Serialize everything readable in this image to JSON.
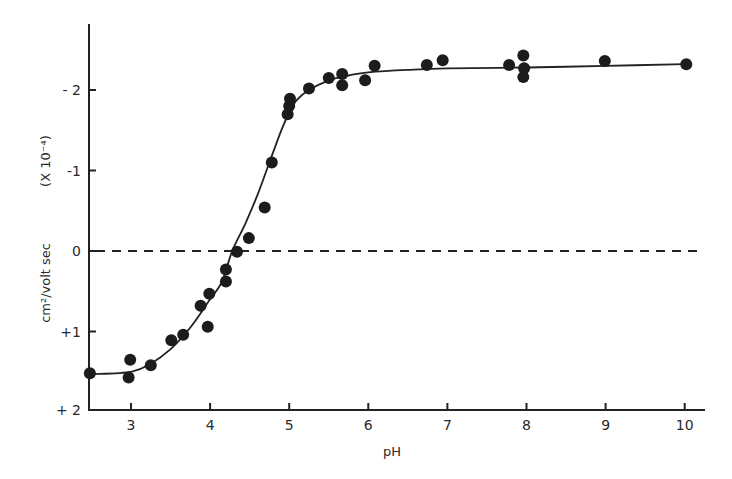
{
  "chart_data": {
    "type": "scatter",
    "title": "",
    "xlabel": "pH",
    "ylabel": "cm²/volt sec   (X 10⁻⁴)",
    "ylabel_parts": {
      "units": "cm²/volt sec",
      "scale": "(X 10⁻⁴)"
    },
    "xlim": [
      2.5,
      10.25
    ],
    "ylim": [
      2,
      -2.8
    ],
    "y_axis_inverted": true,
    "grid": false,
    "legend": null,
    "x_ticks": [
      3,
      4,
      5,
      6,
      7,
      8,
      9,
      10
    ],
    "x_tick_labels": [
      "3",
      "4",
      "5",
      "6",
      "7",
      "8",
      "9",
      "10"
    ],
    "y_ticks": [
      -2,
      -1,
      0,
      1,
      2
    ],
    "y_tick_labels": [
      "- 2",
      "-1",
      "0",
      "+1",
      "+ 2"
    ],
    "reference_line": {
      "y": 0,
      "style": "dashed"
    },
    "series": [
      {
        "name": "measured mobility",
        "marker": "filled-circle",
        "points": [
          [
            2.48,
            1.52
          ],
          [
            2.99,
            1.35
          ],
          [
            2.97,
            1.57
          ],
          [
            3.25,
            1.42
          ],
          [
            3.51,
            1.11
          ],
          [
            3.66,
            1.04
          ],
          [
            3.88,
            0.68
          ],
          [
            3.99,
            0.53
          ],
          [
            3.97,
            0.94
          ],
          [
            4.2,
            0.38
          ],
          [
            4.2,
            0.23
          ],
          [
            4.34,
            0.01
          ],
          [
            4.49,
            -0.16
          ],
          [
            4.69,
            -0.54
          ],
          [
            4.78,
            -1.1
          ],
          [
            4.98,
            -1.7
          ],
          [
            5.0,
            -1.8
          ],
          [
            5.01,
            -1.89
          ],
          [
            5.25,
            -2.02
          ],
          [
            5.5,
            -2.15
          ],
          [
            5.67,
            -2.2
          ],
          [
            5.67,
            -2.06
          ],
          [
            5.96,
            -2.12
          ],
          [
            6.08,
            -2.3
          ],
          [
            6.74,
            -2.31
          ],
          [
            6.94,
            -2.37
          ],
          [
            7.78,
            -2.31
          ],
          [
            7.96,
            -2.43
          ],
          [
            7.97,
            -2.27
          ],
          [
            7.96,
            -2.16
          ],
          [
            8.99,
            -2.36
          ],
          [
            10.02,
            -2.32
          ]
        ]
      },
      {
        "name": "fitted curve",
        "style": "solid-line",
        "points": [
          [
            2.5,
            1.53
          ],
          [
            3.0,
            1.5
          ],
          [
            3.25,
            1.4
          ],
          [
            3.5,
            1.22
          ],
          [
            3.75,
            0.95
          ],
          [
            4.0,
            0.6
          ],
          [
            4.15,
            0.38
          ],
          [
            4.28,
            0.0
          ],
          [
            4.45,
            -0.35
          ],
          [
            4.6,
            -0.7
          ],
          [
            4.75,
            -1.1
          ],
          [
            4.9,
            -1.5
          ],
          [
            5.0,
            -1.72
          ],
          [
            5.1,
            -1.88
          ],
          [
            5.25,
            -2.0
          ],
          [
            5.5,
            -2.12
          ],
          [
            5.75,
            -2.18
          ],
          [
            6.0,
            -2.22
          ],
          [
            6.5,
            -2.25
          ],
          [
            7.0,
            -2.27
          ],
          [
            8.0,
            -2.28
          ],
          [
            9.0,
            -2.3
          ],
          [
            10.0,
            -2.32
          ]
        ]
      }
    ]
  }
}
